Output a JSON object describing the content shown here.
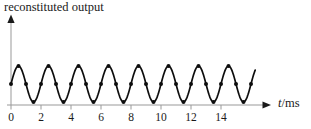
{
  "figure": {
    "title": "reconstituted output",
    "x_axis": {
      "label_variable": "t",
      "label_unit": "/ms"
    }
  },
  "chart_data": {
    "type": "line",
    "title": "reconstituted output",
    "xlabel": "t/ms",
    "ylabel": "",
    "x_ticks": [
      0,
      2,
      4,
      6,
      8,
      10,
      12,
      14
    ],
    "x_range": [
      0,
      16.3
    ],
    "grid": false,
    "legend": null,
    "wave": {
      "shape": "sine",
      "period_ms": 2,
      "amplitude_norm": 1,
      "start": "zero crossing, rising, at t = 0"
    },
    "samples": {
      "marker": "filled-dot",
      "interval_ms": 0.5,
      "t_start_ms": 0,
      "t_end_ms": 16,
      "values_norm": [
        0,
        1,
        0,
        -1,
        0,
        1,
        0,
        -1,
        0,
        1,
        0,
        -1,
        0,
        1,
        0,
        -1,
        0,
        1,
        0,
        -1,
        0,
        1,
        0,
        -1,
        0,
        1,
        0,
        -1,
        0,
        1,
        0,
        -1,
        0
      ]
    },
    "colors": {
      "curve": "#0d0d0d",
      "dot": "#0d0d0d",
      "axis": "#999999",
      "arrow": "#1a1a1a",
      "text": "#1a1a1a"
    }
  }
}
